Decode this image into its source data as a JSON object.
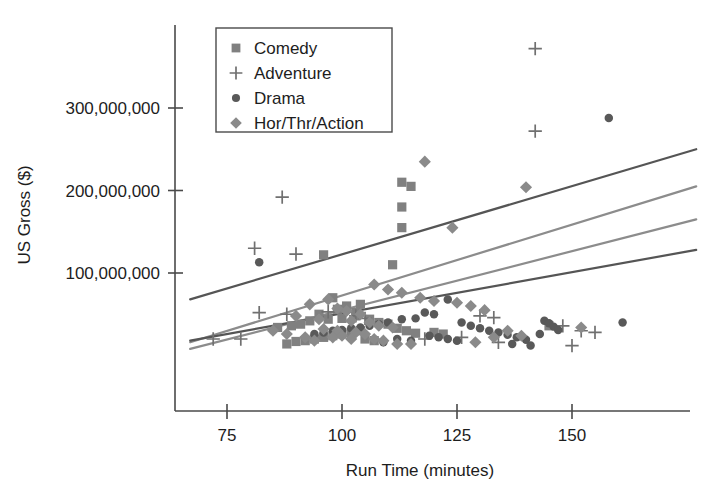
{
  "chart_data": {
    "type": "scatter",
    "title": "",
    "xlabel": "Run Time (minutes)",
    "ylabel": "US Gross ($)",
    "xlim": [
      67,
      178
    ],
    "ylim": [
      -8000000,
      390000000
    ],
    "xticks": [
      75,
      100,
      125,
      150
    ],
    "xtick_labels": [
      "75",
      "100",
      "125",
      "150"
    ],
    "yticks": [
      100000000,
      200000000,
      300000000
    ],
    "ytick_labels": [
      "100,000,000",
      "200,000,000",
      "300,000,000"
    ],
    "grid": false,
    "legend_position": "upper-left-inside",
    "series": [
      {
        "name": "Comedy",
        "marker": "square",
        "color": "#808080",
        "points": [
          [
            113,
            210000000
          ],
          [
            115,
            205000000
          ],
          [
            113,
            180000000
          ],
          [
            113,
            155000000
          ],
          [
            96,
            122000000
          ],
          [
            111,
            110000000
          ],
          [
            104,
            62000000
          ],
          [
            101,
            60000000
          ],
          [
            98,
            70000000
          ],
          [
            99,
            56000000
          ],
          [
            95,
            50000000
          ],
          [
            103,
            52000000
          ],
          [
            103,
            48000000
          ],
          [
            100,
            45000000
          ],
          [
            97,
            44000000
          ],
          [
            93,
            42000000
          ],
          [
            91,
            38000000
          ],
          [
            89,
            36000000
          ],
          [
            86,
            34000000
          ],
          [
            106,
            44000000
          ],
          [
            108,
            40000000
          ],
          [
            110,
            38000000
          ],
          [
            112,
            33000000
          ],
          [
            114,
            30000000
          ],
          [
            116,
            27000000
          ],
          [
            104,
            30000000
          ],
          [
            102,
            28000000
          ],
          [
            100,
            26000000
          ],
          [
            98,
            24000000
          ],
          [
            96,
            22000000
          ],
          [
            94,
            20000000
          ],
          [
            92,
            18000000
          ],
          [
            90,
            17000000
          ],
          [
            88,
            14000000
          ],
          [
            145,
            36000000
          ],
          [
            120,
            28000000
          ],
          [
            122,
            26000000
          ],
          [
            105,
            20000000
          ],
          [
            107,
            18000000
          ]
        ]
      },
      {
        "name": "Adventure",
        "marker": "plus",
        "color": "#707070",
        "points": [
          [
            142,
            372000000
          ],
          [
            87,
            192000000
          ],
          [
            142,
            272000000
          ],
          [
            81,
            130000000
          ],
          [
            90,
            123000000
          ],
          [
            82,
            52000000
          ],
          [
            88,
            50000000
          ],
          [
            97,
            53000000
          ],
          [
            130,
            48000000
          ],
          [
            133,
            46000000
          ],
          [
            103,
            48000000
          ],
          [
            105,
            45000000
          ],
          [
            72,
            20000000
          ],
          [
            78,
            20000000
          ],
          [
            118,
            20000000
          ],
          [
            126,
            22000000
          ],
          [
            134,
            16000000
          ],
          [
            148,
            36000000
          ],
          [
            150,
            12000000
          ],
          [
            152,
            30000000
          ],
          [
            155,
            28000000
          ]
        ]
      },
      {
        "name": "Drama",
        "marker": "circle",
        "color": "#595959",
        "points": [
          [
            158,
            288000000
          ],
          [
            82,
            113000000
          ],
          [
            123,
            68000000
          ],
          [
            118,
            52000000
          ],
          [
            120,
            50000000
          ],
          [
            116,
            45000000
          ],
          [
            113,
            44000000
          ],
          [
            110,
            40000000
          ],
          [
            108,
            38000000
          ],
          [
            106,
            36000000
          ],
          [
            104,
            34000000
          ],
          [
            102,
            33000000
          ],
          [
            100,
            31000000
          ],
          [
            98,
            30000000
          ],
          [
            96,
            28000000
          ],
          [
            94,
            26000000
          ],
          [
            126,
            40000000
          ],
          [
            128,
            36000000
          ],
          [
            130,
            33000000
          ],
          [
            132,
            30000000
          ],
          [
            134,
            28000000
          ],
          [
            136,
            25000000
          ],
          [
            138,
            22000000
          ],
          [
            140,
            19000000
          ],
          [
            144,
            42000000
          ],
          [
            145,
            39000000
          ],
          [
            146,
            35000000
          ],
          [
            147,
            31000000
          ],
          [
            161,
            40000000
          ],
          [
            119,
            24000000
          ],
          [
            121,
            22000000
          ],
          [
            123,
            20000000
          ],
          [
            125,
            18000000
          ],
          [
            112,
            20000000
          ],
          [
            115,
            18000000
          ],
          [
            109,
            16000000
          ],
          [
            137,
            14000000
          ],
          [
            143,
            26000000
          ],
          [
            141,
            12000000
          ]
        ]
      },
      {
        "name": "Hor/Thr/Action",
        "marker": "diamond",
        "color": "#8a8a8a",
        "points": [
          [
            118,
            235000000
          ],
          [
            140,
            204000000
          ],
          [
            124,
            155000000
          ],
          [
            107,
            86000000
          ],
          [
            110,
            80000000
          ],
          [
            113,
            76000000
          ],
          [
            117,
            70000000
          ],
          [
            120,
            66000000
          ],
          [
            125,
            64000000
          ],
          [
            128,
            60000000
          ],
          [
            131,
            55000000
          ],
          [
            97,
            68000000
          ],
          [
            93,
            62000000
          ],
          [
            99,
            57000000
          ],
          [
            101,
            54000000
          ],
          [
            104,
            50000000
          ],
          [
            90,
            48000000
          ],
          [
            95,
            44000000
          ],
          [
            102,
            42000000
          ],
          [
            106,
            40000000
          ],
          [
            108,
            36000000
          ],
          [
            111,
            34000000
          ],
          [
            96,
            32000000
          ],
          [
            99,
            30000000
          ],
          [
            103,
            28000000
          ],
          [
            105,
            26000000
          ],
          [
            100,
            24000000
          ],
          [
            98,
            22000000
          ],
          [
            102,
            20000000
          ],
          [
            107,
            20000000
          ],
          [
            109,
            18000000
          ],
          [
            94,
            18000000
          ],
          [
            92,
            22000000
          ],
          [
            133,
            22000000
          ],
          [
            136,
            30000000
          ],
          [
            139,
            24000000
          ],
          [
            152,
            34000000
          ],
          [
            88,
            26000000
          ],
          [
            85,
            30000000
          ],
          [
            129,
            16000000
          ],
          [
            112,
            14000000
          ],
          [
            115,
            14000000
          ]
        ]
      }
    ],
    "trendlines": [
      {
        "name": "trend-top",
        "color": "#555555",
        "width": 2.2,
        "x0": 67,
        "y0": 68000000,
        "x1": 177,
        "y1": 250000000
      },
      {
        "name": "trend-second",
        "color": "#8c8c8c",
        "width": 2.2,
        "x0": 67,
        "y0": 16000000,
        "x1": 177,
        "y1": 205000000
      },
      {
        "name": "trend-third",
        "color": "#8c8c8c",
        "width": 2.2,
        "x0": 67,
        "y0": 8000000,
        "x1": 177,
        "y1": 165000000
      },
      {
        "name": "trend-bottom",
        "color": "#555555",
        "width": 2.2,
        "x0": 67,
        "y0": 18000000,
        "x1": 177,
        "y1": 128000000
      }
    ]
  },
  "legend": {
    "items": [
      {
        "label": "Comedy",
        "marker": "square",
        "color": "#808080"
      },
      {
        "label": "Adventure",
        "marker": "plus",
        "color": "#707070"
      },
      {
        "label": "Drama",
        "marker": "circle",
        "color": "#595959"
      },
      {
        "label": "Hor/Thr/Action",
        "marker": "diamond",
        "color": "#8a8a8a"
      }
    ]
  }
}
